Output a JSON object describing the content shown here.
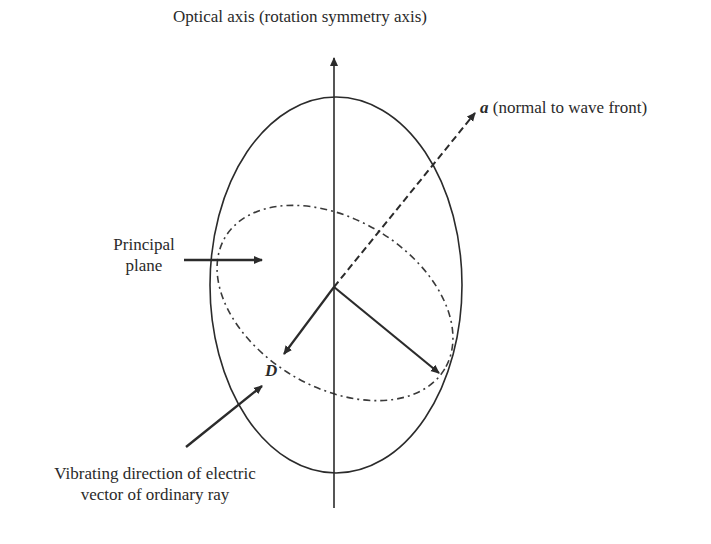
{
  "labels": {
    "optical_axis": "Optical axis (rotation symmetry axis)",
    "normal_symbol": "a",
    "normal_text": " (normal to wave front)",
    "principal_plane_line1": "Principal",
    "principal_plane_line2": "plane",
    "d_symbol": "D",
    "vibrating_line1": "Vibrating direction of electric",
    "vibrating_line2": "vector of ordinary ray"
  },
  "colors": {
    "stroke": "#2b2b2b",
    "background": "#ffffff"
  }
}
